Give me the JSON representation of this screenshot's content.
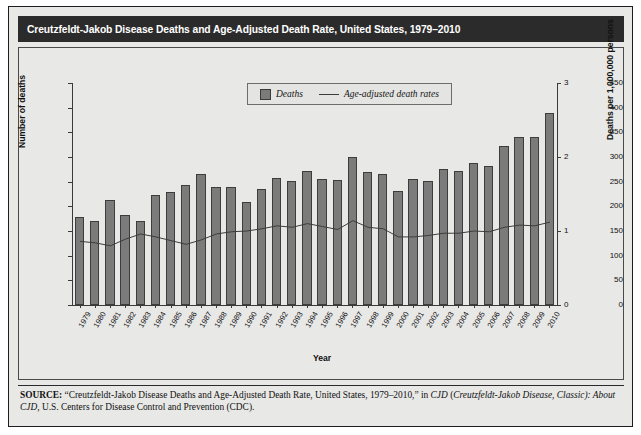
{
  "figure": {
    "title": "Creutzfeldt-Jakob Disease Deaths and Age-Adjusted Death Rate, United States, 1979–2010",
    "background_color": "#e8e8e6",
    "title_band_color": "#2b2b2b",
    "bar_color": "#7b7b7b",
    "line_color": "#3c3c3c"
  },
  "legend": {
    "position": "top-center",
    "entries": [
      {
        "label": "Deaths",
        "marker": "swatch"
      },
      {
        "label": "Age-adjusted death rates",
        "marker": "line"
      }
    ]
  },
  "source": {
    "prefix": "SOURCE:",
    "line1_plain_a": " “Creutzfeldt-Jakob Disease Deaths and Age-Adjusted Death Rate, United States, 1979–2010,” in ",
    "line1_italic_a": "CJD",
    "line1_plain_b": " (",
    "line1_italic_b": "Creutzfeldt-Jakob Disease, Classic): About CJD",
    "line1_plain_c": ", U.S. Centers for Disease Control and Prevention (CDC)."
  },
  "chart_data": {
    "type": "bar",
    "title": "Creutzfeldt-Jakob Disease Deaths and Age-Adjusted Death Rate, United States, 1979–2010",
    "xlabel": "Year",
    "ylabel": "Number of deaths",
    "ylabel_right": "Deaths per 1,000,000 persons",
    "ylim": [
      0,
      450
    ],
    "ylim_right": [
      0,
      3
    ],
    "yticks": [
      0,
      50,
      100,
      150,
      200,
      250,
      300,
      350,
      400,
      450
    ],
    "yticks_right": [
      0,
      1,
      2,
      3
    ],
    "grid": false,
    "legend_position": "top-center",
    "categories": [
      "1979",
      "1980",
      "1981",
      "1982",
      "1983",
      "1984",
      "1985",
      "1986",
      "1987",
      "1988",
      "1989",
      "1990",
      "1991",
      "1992",
      "1993",
      "1994",
      "1995",
      "1996",
      "1997",
      "1998",
      "1999",
      "2000",
      "2001",
      "2002",
      "2003",
      "2004",
      "2005",
      "2006",
      "2007",
      "2008",
      "2009",
      "2010"
    ],
    "series": [
      {
        "name": "Deaths",
        "type": "bar",
        "axis": "left",
        "unit": "deaths",
        "values": [
          179,
          171,
          212,
          183,
          170,
          222,
          230,
          244,
          265,
          240,
          239,
          208,
          236,
          258,
          252,
          272,
          256,
          254,
          300,
          270,
          266,
          232,
          256,
          252,
          275,
          272,
          287,
          282,
          322,
          341,
          340,
          390
        ]
      },
      {
        "name": "Age-adjusted death rates",
        "type": "line",
        "axis": "right",
        "unit": "deaths per 1,000,000 persons",
        "values": [
          0.86,
          0.84,
          0.8,
          0.89,
          0.96,
          0.92,
          0.87,
          0.82,
          0.88,
          0.96,
          0.99,
          1.0,
          1.03,
          1.07,
          1.05,
          1.1,
          1.06,
          1.02,
          1.14,
          1.05,
          1.03,
          0.92,
          0.92,
          0.94,
          0.97,
          0.97,
          1.0,
          0.99,
          1.05,
          1.08,
          1.07,
          1.12
        ]
      }
    ]
  }
}
